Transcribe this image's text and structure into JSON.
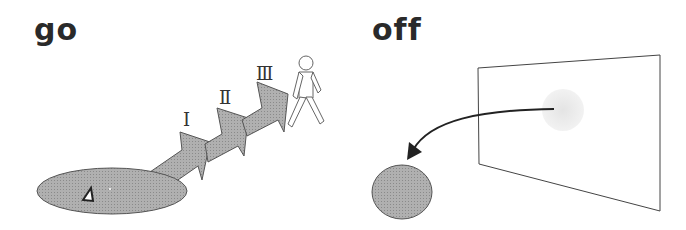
{
  "panels": {
    "left": {
      "title": "go",
      "stages": [
        "Ⅰ",
        "Ⅱ",
        "Ⅲ"
      ]
    },
    "right": {
      "title": "off"
    }
  },
  "colors": {
    "fill": "#a8a8a8",
    "stroke": "#555555",
    "text": "#2a2a2a"
  }
}
